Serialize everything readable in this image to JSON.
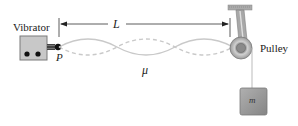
{
  "labels": {
    "vibrator": "Vibrator",
    "point": "P",
    "length": "L",
    "density": "μ",
    "pulley": "Pulley",
    "mass": "m"
  },
  "colors": {
    "box_fill": "#c8c8c8",
    "box_stroke": "#7a7a7a",
    "string": "#c9c9c9",
    "mass_fill": "#9a9a9a",
    "pulley_fill": "#b5b5b5"
  },
  "wave": {
    "x_start": 59,
    "x_end": 233,
    "center_y": 47,
    "amplitude": 8,
    "loops": 3
  }
}
